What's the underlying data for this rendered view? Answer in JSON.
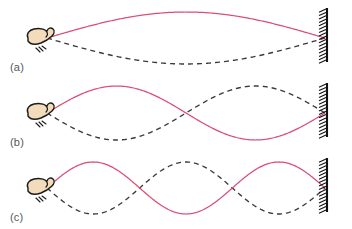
{
  "figure": {
    "background_color": "#ffffff"
  },
  "colors": {
    "solid_wave": "#d94e75",
    "dashed_wave": "#3b3b3b",
    "wall": "#111111",
    "hand_fill": "#f2dcbb",
    "hand_outline": "#1a1a1a",
    "label_text": "#55585c"
  },
  "geometry": {
    "string_left_x": 47,
    "string_right_x": 325,
    "axis_y": 38
  },
  "panels": [
    {
      "id": "a",
      "label": "(a)",
      "harmonic": 1,
      "antinodes": 1,
      "amplitude": 26,
      "hand_label": "hand-shaking-string",
      "wall_label": "fixed-wall-support"
    },
    {
      "id": "b",
      "label": "(b)",
      "harmonic": 2,
      "antinodes": 2,
      "amplitude": 27,
      "hand_label": "hand-shaking-string",
      "wall_label": "fixed-wall-support"
    },
    {
      "id": "c",
      "label": "(c)",
      "harmonic": 3,
      "antinodes": 3,
      "amplitude": 26,
      "hand_label": "hand-shaking-string",
      "wall_label": "fixed-wall-support"
    }
  ],
  "chart_data": {
    "type": "line",
    "xlabel": "",
    "ylabel": "",
    "xlim": [
      47,
      325
    ],
    "ylim": [
      -28,
      28
    ],
    "grid": false,
    "legend": "none",
    "series": [
      {
        "name": "(a) first harmonic — solid (instant 1)",
        "style": "solid",
        "color": "#d94e75",
        "harmonic": 1,
        "amplitude": 26,
        "phase": "positive"
      },
      {
        "name": "(a) first harmonic — dashed (instant 2, half period later)",
        "style": "dashed",
        "color": "#3b3b3b",
        "harmonic": 1,
        "amplitude": 26,
        "phase": "negative"
      },
      {
        "name": "(b) second harmonic — solid (instant 1)",
        "style": "solid",
        "color": "#d94e75",
        "harmonic": 2,
        "amplitude": 27,
        "phase": "positive"
      },
      {
        "name": "(b) second harmonic — dashed (instant 2, half period later)",
        "style": "dashed",
        "color": "#3b3b3b",
        "harmonic": 2,
        "amplitude": 27,
        "phase": "negative"
      },
      {
        "name": "(c) third harmonic — solid (instant 1)",
        "style": "solid",
        "color": "#d94e75",
        "harmonic": 3,
        "amplitude": 26,
        "phase": "positive"
      },
      {
        "name": "(c) third harmonic — dashed (instant 2, half period later)",
        "style": "dashed",
        "color": "#3b3b3b",
        "harmonic": 3,
        "amplitude": 26,
        "phase": "negative"
      }
    ],
    "annotations": [
      "(a)",
      "(b)",
      "(c)"
    ]
  }
}
